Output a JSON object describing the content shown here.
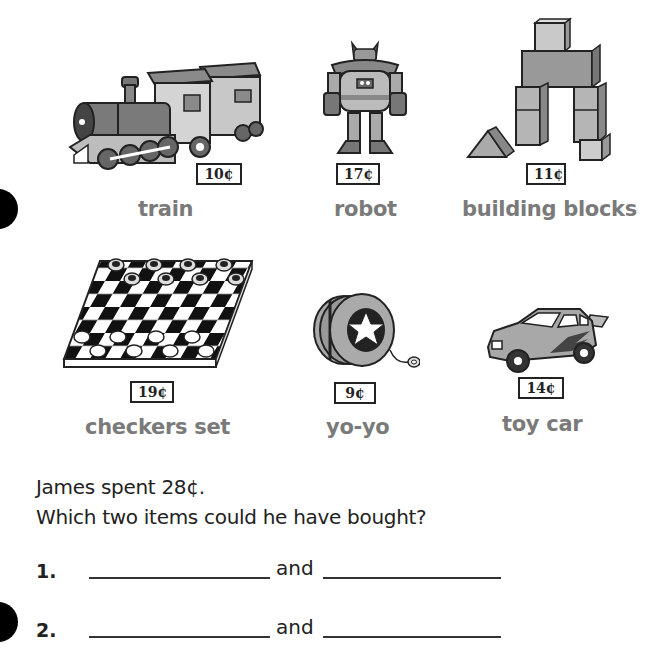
{
  "items": [
    {
      "name": "train",
      "price": "10¢",
      "icon": "train-icon"
    },
    {
      "name": "robot",
      "price": "17¢",
      "icon": "robot-icon"
    },
    {
      "name": "building blocks",
      "price": "11¢",
      "icon": "building-blocks-icon"
    },
    {
      "name": "checkers set",
      "price": "19¢",
      "icon": "checkers-set-icon"
    },
    {
      "name": "yo-yo",
      "price": "9¢",
      "icon": "yo-yo-icon"
    },
    {
      "name": "toy car",
      "price": "14¢",
      "icon": "toy-car-icon"
    }
  ],
  "problem": {
    "statement": "James spent 28¢.",
    "question": "Which two items could he have bought?"
  },
  "answers": [
    {
      "number": "1.",
      "connector": "and"
    },
    {
      "number": "2.",
      "connector": "and"
    }
  ]
}
